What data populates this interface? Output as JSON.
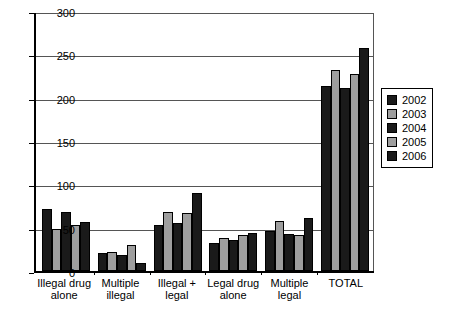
{
  "chart_data": {
    "type": "bar",
    "title": "",
    "subtitle": "",
    "xlabel": "",
    "ylabel": "",
    "ylim": [
      0,
      300
    ],
    "yticks": [
      0,
      50,
      100,
      150,
      200,
      250,
      300
    ],
    "ytick_labels": [
      "0",
      "50",
      "100",
      "150",
      "200",
      "250",
      "300"
    ],
    "grid": true,
    "legend_position": "right",
    "categories": [
      "Illegal drug alone",
      "Multiple illegal",
      "Illegal + legal",
      "Legal drug alone",
      "Multiple legal",
      "TOTAL"
    ],
    "category_lines": [
      [
        "Illegal drug",
        "alone"
      ],
      [
        "Multiple",
        "illegal"
      ],
      [
        "Illegal +",
        "legal"
      ],
      [
        "Legal drug",
        "alone"
      ],
      [
        "Multiple",
        "legal"
      ],
      [
        "TOTAL",
        ""
      ]
    ],
    "series": [
      {
        "name": "2002",
        "color": "#1a1a1a",
        "values": [
          72,
          21,
          53,
          32,
          46,
          213
        ]
      },
      {
        "name": "2003",
        "color": "#9e9e9e",
        "values": [
          49,
          22,
          68,
          38,
          58,
          232
        ]
      },
      {
        "name": "2004",
        "color": "#1a1a1a",
        "values": [
          68,
          18,
          55,
          36,
          43,
          211
        ]
      },
      {
        "name": "2005",
        "color": "#9e9e9e",
        "values": [
          53,
          30,
          67,
          41,
          41,
          227
        ]
      },
      {
        "name": "2006",
        "color": "#1a1a1a",
        "values": [
          56,
          9,
          90,
          44,
          61,
          257
        ]
      }
    ]
  },
  "legend": {
    "items": [
      {
        "label": "2002",
        "color": "#1a1a1a"
      },
      {
        "label": "2003",
        "color": "#9e9e9e"
      },
      {
        "label": "2004",
        "color": "#1a1a1a"
      },
      {
        "label": "2005",
        "color": "#9e9e9e"
      },
      {
        "label": "2006",
        "color": "#1a1a1a"
      }
    ]
  }
}
